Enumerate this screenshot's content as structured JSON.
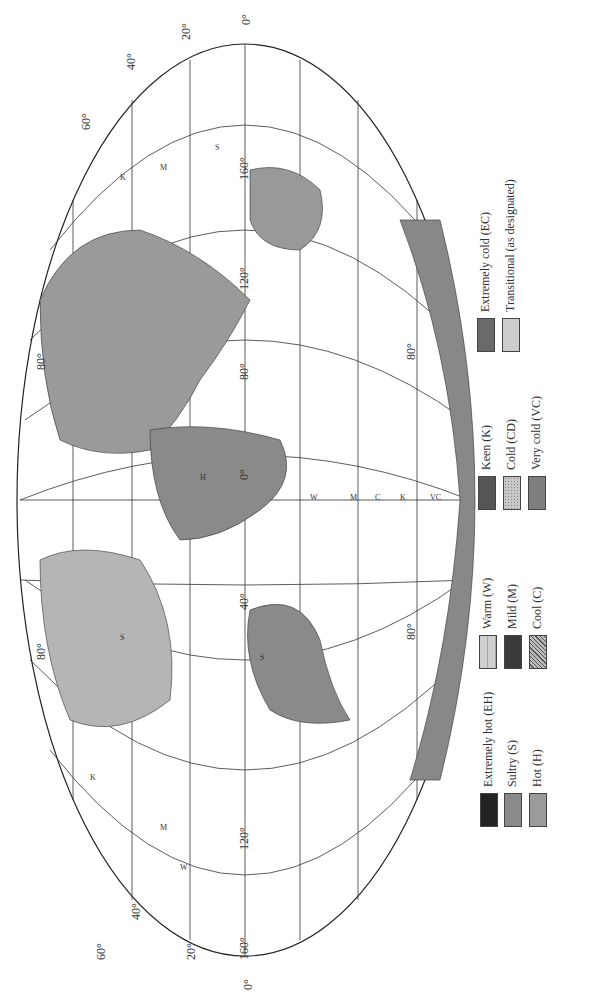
{
  "figure": {
    "type": "world map of climate/comfort zones (rotated 90°, north to the left)",
    "projection": "elliptical (Mollweide-like)"
  },
  "legend": {
    "items": [
      {
        "code": "EH",
        "label": "Extremely hot (EH)",
        "color": "#222222",
        "pattern": "solid"
      },
      {
        "code": "S",
        "label": "Sultry (S)",
        "color": "#8a8a8a",
        "pattern": "solid"
      },
      {
        "code": "H",
        "label": "Hot (H)",
        "color": "#9b9b9b",
        "pattern": "solid"
      },
      {
        "code": "W",
        "label": "Warm (W)",
        "color": "#cfcfcf",
        "pattern": "vertical lines"
      },
      {
        "code": "M",
        "label": "Mild (M)",
        "color": "#3a3a3a",
        "pattern": "solid"
      },
      {
        "code": "C",
        "label": "Cool (C)",
        "color": "#888888",
        "pattern": "diagonal hatch"
      },
      {
        "code": "K",
        "label": "Keen (K)",
        "color": "#555555",
        "pattern": "solid"
      },
      {
        "code": "CD",
        "label": "Cold (CD)",
        "color": "#c8c8c8",
        "pattern": "dotted"
      },
      {
        "code": "VC",
        "label": "Very cold (VC)",
        "color": "#7e7e7e",
        "pattern": "solid"
      },
      {
        "code": "EC",
        "label": "Extremely cold (EC)",
        "color": "#6a6a6a",
        "pattern": "solid"
      },
      {
        "code": "T",
        "label": "Transitional (as designated)",
        "color": "#cdcdcd",
        "pattern": "solid"
      }
    ]
  },
  "graticule": {
    "latitude_labels": [
      "80°",
      "60°",
      "40°",
      "20°",
      "0°",
      "20°",
      "40°",
      "60°",
      "80°"
    ],
    "longitude_labels": [
      "160°",
      "120°",
      "80°",
      "40°",
      "0°",
      "40°",
      "80°",
      "120°",
      "160°"
    ],
    "edge_labels_top": [
      "60°",
      "40°",
      "20°",
      "0°",
      "20°",
      "40°",
      "60°"
    ],
    "edge_labels_bottom": [
      "60°",
      "40°",
      "20°",
      "0°",
      "20°",
      "40°",
      "60°"
    ]
  },
  "zone_labels": [
    "K",
    "M",
    "W",
    "S",
    "H",
    "C",
    "CD",
    "VC",
    "EC",
    "EH",
    "K–M–S",
    "VC–K–M",
    "CD–K–M",
    "CD–K–W",
    "EC–K",
    "EC–C",
    "VC–K",
    "K–H",
    "M–W",
    "C–M–W",
    "K–M–W",
    "C–M",
    "C–S",
    "W–S",
    "M–H"
  ]
}
